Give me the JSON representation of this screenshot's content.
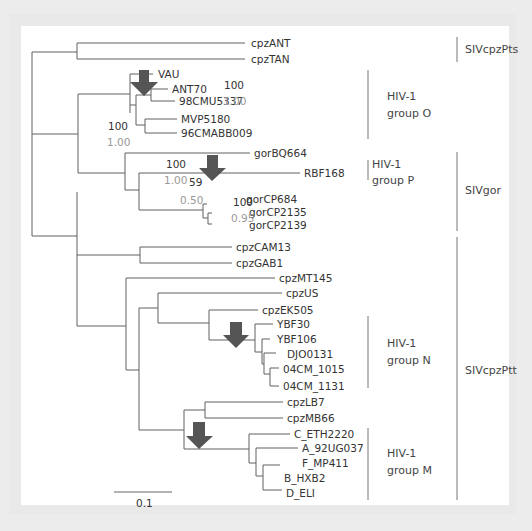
{
  "figure": {
    "type": "phylogenetic_tree",
    "scale_bar": {
      "label": "0.1"
    },
    "leaves": [
      {
        "id": "cpzANT",
        "label": "cpzANT"
      },
      {
        "id": "cpzTAN",
        "label": "cpzTAN"
      },
      {
        "id": "VAU",
        "label": "VAU"
      },
      {
        "id": "ANT70",
        "label": "ANT70"
      },
      {
        "id": "98CMU5337",
        "label": "98CMU5337"
      },
      {
        "id": "MVP5180",
        "label": "MVP5180"
      },
      {
        "id": "96CMABB009",
        "label": "96CMABB009"
      },
      {
        "id": "gorBQ664",
        "label": "gorBQ664"
      },
      {
        "id": "RBF168",
        "label": "RBF168"
      },
      {
        "id": "gorCP684",
        "label": "gorCP684"
      },
      {
        "id": "gorCP2135",
        "label": "gorCP2135"
      },
      {
        "id": "gorCP2139",
        "label": "gorCP2139"
      },
      {
        "id": "cpzCAM13",
        "label": "cpzCAM13"
      },
      {
        "id": "cpzGAB1",
        "label": "cpzGAB1"
      },
      {
        "id": "cpzMT145",
        "label": "cpzMT145"
      },
      {
        "id": "cpzUS",
        "label": "cpzUS"
      },
      {
        "id": "cpzEK505",
        "label": "cpzEK505"
      },
      {
        "id": "YBF30",
        "label": "YBF30"
      },
      {
        "id": "YBF106",
        "label": "YBF106"
      },
      {
        "id": "DJO0131",
        "label": "DJO0131"
      },
      {
        "id": "04CM_1015",
        "label": "04CM_1015"
      },
      {
        "id": "04CM_1131",
        "label": "04CM_1131"
      },
      {
        "id": "cpzLB7",
        "label": "cpzLB7"
      },
      {
        "id": "cpzMB66",
        "label": "cpzMB66"
      },
      {
        "id": "C_ETH2220",
        "label": "C_ETH2220"
      },
      {
        "id": "A_92UG037",
        "label": "A_92UG037"
      },
      {
        "id": "F_MP411",
        "label": "F_MP411"
      },
      {
        "id": "B_HXB2",
        "label": "B_HXB2"
      },
      {
        "id": "D_ELI",
        "label": "D_ELI"
      }
    ],
    "support_values": [
      {
        "node": "OPgor",
        "bootstrap": "100",
        "posterior": "1.00"
      },
      {
        "node": "groupO",
        "bootstrap": "100",
        "posterior": "1.00"
      },
      {
        "node": "Pgor",
        "bootstrap": "100",
        "posterior": "1.00"
      },
      {
        "node": "P_sister",
        "bootstrap": "59",
        "posterior": "0.50"
      },
      {
        "node": "gorCP",
        "bootstrap": "100",
        "posterior": "0.95"
      }
    ],
    "inner_groups": [
      {
        "line1": "HIV-1",
        "line2": "group O"
      },
      {
        "line1": "HIV-1",
        "line2": "group P"
      },
      {
        "line1": "HIV-1",
        "line2": "group N"
      },
      {
        "line1": "HIV-1",
        "line2": "group M"
      }
    ],
    "outer_groups": [
      {
        "label": "SIVcpzPts"
      },
      {
        "label": "SIVgor"
      },
      {
        "label": "SIVcpzPtt"
      }
    ],
    "arrows": [
      {
        "name": "arrow-group-O"
      },
      {
        "name": "arrow-group-P"
      },
      {
        "name": "arrow-group-N"
      },
      {
        "name": "arrow-group-M"
      }
    ],
    "colors": {
      "branch": "#555555",
      "arrow": "#555555",
      "posterior": "#999999",
      "text": "#333333"
    }
  }
}
